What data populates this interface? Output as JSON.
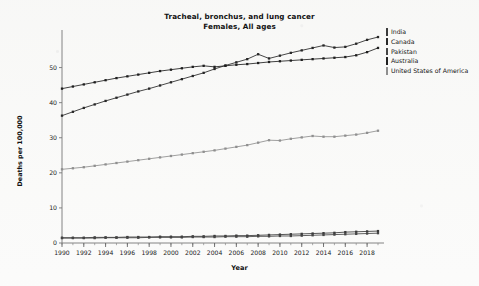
{
  "chart_data": {
    "type": "line",
    "title": "Tracheal, bronchus, and lung cancer",
    "subtitle": "Females, All ages",
    "xlabel": "Year",
    "ylabel": "Deaths per 100,000",
    "xlim": [
      1990,
      2019
    ],
    "ylim": [
      0,
      59
    ],
    "yticks": [
      0,
      10,
      20,
      30,
      40,
      50
    ],
    "xticks": [
      1990,
      1992,
      1994,
      1996,
      1998,
      2000,
      2002,
      2004,
      2006,
      2008,
      2010,
      2012,
      2014,
      2016,
      2018
    ],
    "x": [
      1990,
      1991,
      1992,
      1993,
      1994,
      1995,
      1996,
      1997,
      1998,
      1999,
      2000,
      2001,
      2002,
      2003,
      2004,
      2005,
      2006,
      2007,
      2008,
      2009,
      2010,
      2011,
      2012,
      2013,
      2014,
      2015,
      2016,
      2017,
      2018,
      2019
    ],
    "grid": false,
    "legend_position": "right",
    "series": [
      {
        "name": "India",
        "color": "#3a3a3a",
        "values": [
          1.5,
          1.5,
          1.5,
          1.6,
          1.6,
          1.6,
          1.7,
          1.7,
          1.7,
          1.8,
          1.8,
          1.8,
          1.9,
          1.9,
          2.0,
          2.0,
          2.1,
          2.1,
          2.2,
          2.3,
          2.4,
          2.5,
          2.6,
          2.7,
          2.8,
          2.9,
          3.1,
          3.2,
          3.3,
          3.4
        ]
      },
      {
        "name": "Canada",
        "color": "#272727",
        "values": [
          36.3,
          37.4,
          38.5,
          39.5,
          40.5,
          41.4,
          42.3,
          43.2,
          44.0,
          44.9,
          45.8,
          46.7,
          47.6,
          48.5,
          49.6,
          50.6,
          51.5,
          52.4,
          53.8,
          52.6,
          53.4,
          54.2,
          54.9,
          55.6,
          56.3,
          55.7,
          55.9,
          56.8,
          57.9,
          58.7
        ]
      },
      {
        "name": "Pakistan",
        "color": "#454545",
        "values": [
          1.4,
          1.4,
          1.4,
          1.4,
          1.5,
          1.5,
          1.5,
          1.5,
          1.6,
          1.6,
          1.6,
          1.6,
          1.7,
          1.7,
          1.7,
          1.8,
          1.8,
          1.8,
          1.9,
          1.9,
          2.0,
          2.0,
          2.1,
          2.2,
          2.3,
          2.4,
          2.5,
          2.6,
          2.7,
          2.8
        ]
      },
      {
        "name": "Australia",
        "color": "#1f1f1f",
        "values": [
          44.0,
          44.6,
          45.2,
          45.8,
          46.4,
          47.0,
          47.5,
          48.0,
          48.5,
          49.0,
          49.4,
          49.8,
          50.2,
          50.5,
          50.2,
          50.5,
          50.8,
          51.0,
          51.3,
          51.6,
          51.8,
          52.0,
          52.2,
          52.4,
          52.6,
          52.8,
          53.0,
          53.5,
          54.4,
          55.6
        ]
      },
      {
        "name": "United States of America",
        "color": "#8f8f8f",
        "values": [
          21.0,
          21.3,
          21.6,
          22.0,
          22.4,
          22.8,
          23.2,
          23.6,
          24.0,
          24.4,
          24.8,
          25.2,
          25.6,
          26.0,
          26.4,
          26.9,
          27.4,
          27.9,
          28.6,
          29.3,
          29.2,
          29.7,
          30.1,
          30.5,
          30.3,
          30.3,
          30.6,
          30.9,
          31.4,
          32.0
        ]
      }
    ]
  }
}
